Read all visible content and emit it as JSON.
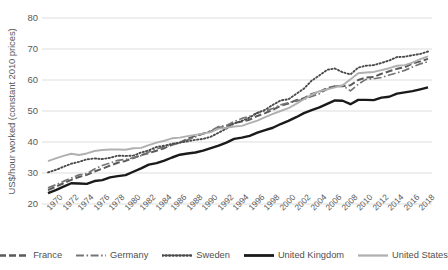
{
  "chart_data": {
    "type": "line",
    "title": "",
    "xlabel": "",
    "ylabel": "US$/hour worked (constant 2010 prices)",
    "ylim": [
      20,
      80
    ],
    "yticks": [
      20,
      30,
      40,
      50,
      60,
      70,
      80
    ],
    "xlim": [
      1970,
      2019
    ],
    "xticks": [
      1970,
      1972,
      1974,
      1976,
      1978,
      1980,
      1982,
      1984,
      1986,
      1988,
      1990,
      1992,
      1994,
      1996,
      1998,
      2000,
      2002,
      2004,
      2006,
      2008,
      2010,
      2012,
      2014,
      2016,
      2018
    ],
    "grid": "horizontal",
    "legend_position": "bottom",
    "x": [
      1970,
      1971,
      1972,
      1973,
      1974,
      1975,
      1976,
      1977,
      1978,
      1979,
      1980,
      1981,
      1982,
      1983,
      1984,
      1985,
      1986,
      1987,
      1988,
      1989,
      1990,
      1991,
      1992,
      1993,
      1994,
      1995,
      1996,
      1997,
      1998,
      1999,
      2000,
      2001,
      2002,
      2003,
      2004,
      2005,
      2006,
      2007,
      2008,
      2009,
      2010,
      2011,
      2012,
      2013,
      2014,
      2015,
      2016,
      2017,
      2018,
      2019
    ],
    "series": [
      {
        "name": "France",
        "style": "dashed",
        "color": "#5a5a5a",
        "values": [
          24.5,
          25.6,
          26.7,
          27.8,
          28.7,
          29.4,
          30.5,
          31.4,
          32.4,
          33.3,
          33.9,
          34.8,
          35.8,
          36.4,
          37.2,
          38.0,
          39.1,
          39.8,
          41.0,
          42.0,
          42.7,
          43.4,
          44.6,
          45.0,
          46.1,
          46.6,
          47.2,
          48.4,
          49.3,
          50.4,
          51.7,
          52.4,
          53.5,
          54.1,
          55.5,
          56.2,
          57.4,
          58.0,
          58.0,
          58.3,
          60.0,
          60.8,
          61.0,
          62.0,
          62.8,
          63.6,
          64.1,
          65.3,
          66.0,
          66.8
        ]
      },
      {
        "name": "Germany",
        "style": "dashdot",
        "color": "#767676",
        "values": [
          25.2,
          26.2,
          27.3,
          28.4,
          29.4,
          29.8,
          31.3,
          32.4,
          33.2,
          34.1,
          34.4,
          34.9,
          35.6,
          36.8,
          37.8,
          38.4,
          39.2,
          39.7,
          40.7,
          41.6,
          42.7,
          43.6,
          45.0,
          45.3,
          46.6,
          47.6,
          48.3,
          49.4,
          50.0,
          50.8,
          52.0,
          52.7,
          53.2,
          53.8,
          54.7,
          55.6,
          57.0,
          58.0,
          58.2,
          56.5,
          58.6,
          60.2,
          60.4,
          60.8,
          61.6,
          62.3,
          63.1,
          64.2,
          65.2,
          65.9
        ]
      },
      {
        "name": "Sweden",
        "style": "dotted",
        "color": "#4a4a4a",
        "values": [
          30.2,
          31.0,
          32.0,
          33.0,
          33.6,
          34.4,
          34.7,
          34.5,
          34.9,
          35.6,
          35.5,
          35.6,
          36.6,
          37.3,
          38.4,
          38.8,
          39.4,
          39.8,
          40.2,
          40.7,
          41.0,
          41.7,
          43.0,
          44.3,
          46.0,
          46.8,
          47.9,
          49.4,
          50.4,
          52.0,
          53.4,
          53.8,
          55.5,
          57.2,
          59.8,
          61.5,
          63.3,
          63.7,
          62.5,
          61.8,
          64.0,
          64.6,
          64.8,
          65.5,
          66.3,
          67.4,
          67.5,
          68.0,
          68.4,
          69.2
        ]
      },
      {
        "name": "United Kingdom",
        "style": "solid",
        "color": "#1a1a1a",
        "values": [
          23.5,
          24.5,
          25.6,
          26.7,
          26.6,
          26.5,
          27.4,
          27.7,
          28.6,
          29.0,
          29.3,
          30.4,
          31.5,
          32.7,
          33.2,
          34.0,
          35.0,
          35.9,
          36.3,
          36.6,
          37.2,
          38.0,
          38.8,
          39.8,
          41.0,
          41.4,
          42.0,
          43.0,
          43.8,
          44.6,
          45.8,
          46.8,
          48.0,
          49.3,
          50.3,
          51.2,
          52.3,
          53.4,
          53.3,
          52.2,
          53.6,
          53.6,
          53.5,
          54.3,
          54.6,
          55.6,
          56.0,
          56.4,
          57.0,
          57.6
        ]
      },
      {
        "name": "United States",
        "style": "solid",
        "color": "#b0b0b0",
        "values": [
          33.8,
          34.7,
          35.5,
          36.2,
          35.8,
          36.3,
          37.1,
          37.4,
          37.6,
          37.6,
          37.5,
          38.0,
          38.1,
          39.0,
          39.8,
          40.4,
          41.2,
          41.4,
          41.9,
          42.3,
          42.7,
          43.2,
          44.3,
          44.6,
          45.0,
          45.2,
          46.1,
          46.9,
          48.0,
          49.1,
          50.0,
          50.9,
          52.3,
          53.8,
          55.3,
          56.4,
          57.0,
          57.6,
          58.3,
          60.2,
          62.2,
          62.4,
          62.6,
          63.2,
          63.8,
          64.6,
          64.8,
          65.6,
          66.7,
          67.6
        ]
      }
    ]
  },
  "legend": {
    "items": [
      {
        "label": "France",
        "swatch": "dashed-line-swatch"
      },
      {
        "label": "Germany",
        "swatch": "dashdot-line-swatch"
      },
      {
        "label": "Sweden",
        "swatch": "dotted-line-swatch"
      },
      {
        "label": "United Kingdom",
        "swatch": "solid-dark-line-swatch"
      },
      {
        "label": "United States",
        "swatch": "solid-light-line-swatch"
      }
    ]
  },
  "axes": {
    "y_title": "US$/hour worked (constant 2010 prices)",
    "y_tick_labels": [
      "80",
      "70",
      "60",
      "50",
      "40",
      "30",
      "20"
    ],
    "x_tick_labels": [
      "1970",
      "1972",
      "1974",
      "1976",
      "1978",
      "1980",
      "1982",
      "1984",
      "1986",
      "1988",
      "1990",
      "1992",
      "1994",
      "1996",
      "1998",
      "2000",
      "2002",
      "2004",
      "2006",
      "2008",
      "2010",
      "2012",
      "2014",
      "2016",
      "2018"
    ]
  },
  "colors": {
    "grid": "#d9d9d9",
    "text": "#5a5a5a",
    "france": "#5a5a5a",
    "germany": "#767676",
    "sweden": "#4a4a4a",
    "united_kingdom": "#1a1a1a",
    "united_states": "#b0b0b0"
  }
}
